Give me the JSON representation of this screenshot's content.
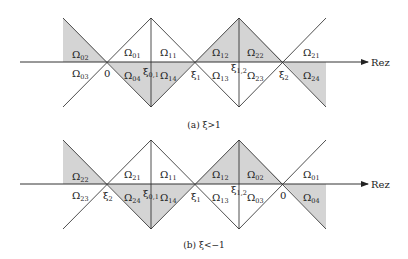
{
  "figure": {
    "axis_label": "Rez",
    "panels": [
      {
        "id": "a",
        "caption": "(a) ξ>1",
        "axis_y": 62,
        "top_y": 18,
        "bottom_y": 107,
        "points": [
          {
            "label": "0",
            "x": 107
          },
          {
            "label": "ξ0,1",
            "x": 151
          },
          {
            "label": "ξ1",
            "x": 195
          },
          {
            "label": "ξ1,2",
            "x": 239
          },
          {
            "label": "ξ2",
            "x": 283
          }
        ],
        "regions": [
          {
            "label": "Ω02",
            "shaded": true
          },
          {
            "label": "Ω03",
            "shaded": false
          },
          {
            "label": "Ω01",
            "shaded": false
          },
          {
            "label": "Ω04",
            "shaded": true
          },
          {
            "label": "Ω11",
            "shaded": false
          },
          {
            "label": "Ω14",
            "shaded": true
          },
          {
            "label": "Ω12",
            "shaded": true
          },
          {
            "label": "Ω13",
            "shaded": false
          },
          {
            "label": "Ω22",
            "shaded": true
          },
          {
            "label": "Ω23",
            "shaded": false
          },
          {
            "label": "Ω21",
            "shaded": false
          },
          {
            "label": "Ω24",
            "shaded": true
          }
        ]
      },
      {
        "id": "b",
        "caption": "(b) ξ<−1",
        "axis_y": 184,
        "top_y": 140,
        "bottom_y": 229,
        "points": [
          {
            "label": "ξ2",
            "x": 107
          },
          {
            "label": "ξ0,1",
            "x": 151
          },
          {
            "label": "ξ1",
            "x": 195
          },
          {
            "label": "ξ1,2",
            "x": 239
          },
          {
            "label": "0",
            "x": 283
          }
        ],
        "regions": [
          {
            "label": "Ω22",
            "shaded": true
          },
          {
            "label": "Ω23",
            "shaded": false
          },
          {
            "label": "Ω21",
            "shaded": false
          },
          {
            "label": "Ω24",
            "shaded": true
          },
          {
            "label": "Ω11",
            "shaded": false
          },
          {
            "label": "Ω14",
            "shaded": true
          },
          {
            "label": "Ω12",
            "shaded": true
          },
          {
            "label": "Ω13",
            "shaded": false
          },
          {
            "label": "Ω02",
            "shaded": true
          },
          {
            "label": "Ω03",
            "shaded": false
          },
          {
            "label": "Ω01",
            "shaded": false
          },
          {
            "label": "Ω04",
            "shaded": true
          }
        ]
      }
    ],
    "colors": {
      "shade": "#d4d4d4",
      "line": "#222222",
      "background": "#ffffff"
    }
  }
}
